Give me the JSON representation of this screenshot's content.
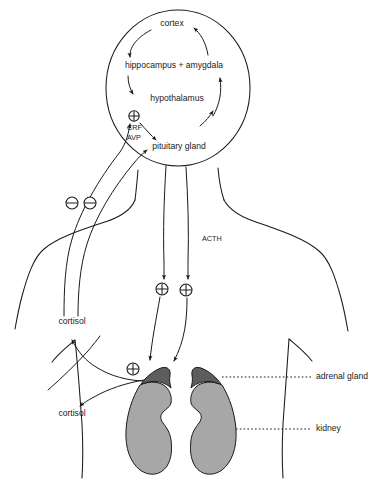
{
  "figure": {
    "brain": {
      "cortex": "cortex",
      "hippocampus_amygdala": "hippocampus + amygdala",
      "hypothalamus": "hypothalamus",
      "pituitary": "pituitary gland"
    },
    "hormones": {
      "crf": "CRF",
      "avp": "AVP",
      "acth": "ACTH",
      "cortisol_upper": "cortisol",
      "cortisol_lower": "cortisol"
    },
    "organs": {
      "adrenal_gland": "adrenal gland",
      "kidney": "kidney"
    },
    "signs": {
      "plus": "⊕",
      "minus": "⊖",
      "plus_hypothalamus": "⊕",
      "plus_acth_left": "⊕",
      "plus_acth_right": "⊕",
      "plus_adrenal": "⊕",
      "minus_left": "⊖",
      "minus_right": "⊖"
    },
    "colors": {
      "ink": "#1a1a1a",
      "kidney_fill": "#a7a7a7",
      "adrenal_fill": "#5d5d5d",
      "background": "#ffffff"
    }
  }
}
